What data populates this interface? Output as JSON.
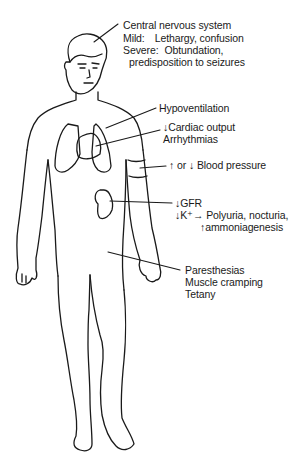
{
  "figure": {
    "type": "human body outline with labeled effects",
    "stroke_color": "#1a1a1a",
    "background": "#ffffff"
  },
  "labels": {
    "cns": {
      "title": "Central nervous system",
      "mild_key": "Mild:",
      "mild_value": "Lethargy, confusion",
      "severe_key": "Severe:",
      "severe_value": "Obtundation,",
      "severe_cont": "predisposition to seizures"
    },
    "lungs": {
      "text": "Hypoventilation"
    },
    "heart": {
      "line1": "↓Cardiac output",
      "line2": "Arrhythmias"
    },
    "arm": {
      "text": "↑ or ↓ Blood pressure"
    },
    "kidney": {
      "line1": "↓GFR",
      "line2": "↓K⁺→ Polyuria, nocturia,",
      "line3": "↑ammoniagenesis"
    },
    "muscle": {
      "line1": "Paresthesias",
      "line2": "Muscle cramping",
      "line3": "Tetany"
    }
  }
}
